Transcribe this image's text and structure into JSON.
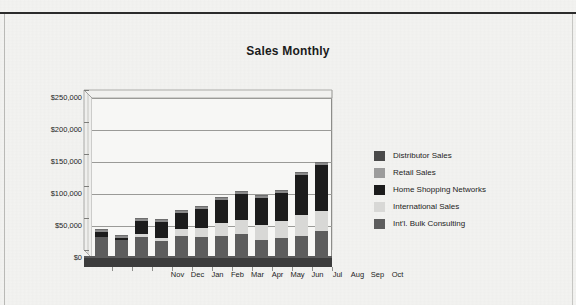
{
  "document": {
    "background_color": "#f3f3f1",
    "rule_color": "#2b2b2b"
  },
  "chart_data": {
    "type": "bar",
    "subtype": "stacked-bar-3d",
    "title": "Sales Monthly",
    "subtitle": "",
    "xlabel": "",
    "ylabel": "",
    "categories": [
      "Nov",
      "Dec",
      "Jan",
      "Feb",
      "Mar",
      "Apr",
      "May",
      "Jun",
      "Jul",
      "Aug",
      "Sep",
      "Oct"
    ],
    "ylim": [
      0,
      250000
    ],
    "yticks": [
      0,
      50000,
      100000,
      150000,
      200000,
      250000
    ],
    "ytick_labels": [
      "$0",
      "$50,000",
      "$100,000",
      "$150,000",
      "$200,000",
      "$250,000"
    ],
    "grid": true,
    "legend_position": "right",
    "series": [
      {
        "name": "Distributor Sales",
        "color": "#4a4a4a",
        "values": [
          0,
          0,
          0,
          0,
          0,
          0,
          0,
          0,
          0,
          0,
          0,
          0
        ]
      },
      {
        "name": "Retail Sales",
        "color": "#9c9c9c",
        "values": [
          0,
          0,
          0,
          0,
          0,
          0,
          0,
          0,
          0,
          0,
          0,
          0
        ]
      },
      {
        "name": "Home Shopping Networks",
        "color": "#1c1c1c",
        "values": [
          8000,
          4000,
          21000,
          26000,
          25000,
          29000,
          35000,
          40000,
          43000,
          44000,
          63000,
          72000
        ]
      },
      {
        "name": "International Sales",
        "color": "#d8d8d6",
        "values": [
          0,
          0,
          4000,
          4000,
          10000,
          14000,
          20000,
          22000,
          23000,
          26000,
          32000,
          32000
        ]
      },
      {
        "name": "Int'l. Bulk Consulting",
        "color": "#5d5d5d",
        "values": [
          33000,
          28000,
          33000,
          27000,
          35000,
          33000,
          35000,
          38000,
          28000,
          32000,
          35000,
          42000
        ]
      }
    ],
    "stack_order_bottom_to_top": [
      "Int'l. Bulk Consulting",
      "International Sales",
      "Home Shopping Networks",
      "Retail Sales",
      "Distributor Sales"
    ],
    "totals": [
      41000,
      32000,
      58000,
      57000,
      70000,
      76000,
      90000,
      100000,
      94000,
      102000,
      130000,
      146000
    ],
    "annotations": []
  },
  "legend": {
    "items": [
      {
        "label": "Distributor Sales",
        "color": "#4a4a4a"
      },
      {
        "label": "Retail Sales",
        "color": "#9c9c9c"
      },
      {
        "label": "Home Shopping Networks",
        "color": "#1c1c1c"
      },
      {
        "label": "International Sales",
        "color": "#d8d8d6"
      },
      {
        "label": "Int'l. Bulk Consulting",
        "color": "#5d5d5d"
      }
    ]
  }
}
